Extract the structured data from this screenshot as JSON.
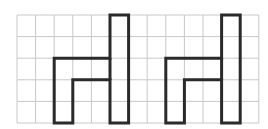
{
  "diagram": {
    "type": "grid-with-shapes",
    "grid": {
      "origin_x": 17,
      "origin_y": 15,
      "cols": 13,
      "rows": 5,
      "cell_w": 18.6,
      "cell_h": 21.6,
      "line_color": "#c8c8c8",
      "line_width": 1
    },
    "shapes": [
      {
        "name": "chair-shape-left",
        "stroke": "#2a2a2a",
        "stroke_width": 3,
        "outline_cells": [
          [
            5,
            0
          ],
          [
            6,
            0
          ],
          [
            6,
            5
          ],
          [
            5,
            5
          ],
          [
            5,
            3
          ],
          [
            3,
            3
          ],
          [
            3,
            5
          ],
          [
            2,
            5
          ],
          [
            2,
            2
          ],
          [
            5,
            2
          ]
        ]
      },
      {
        "name": "chair-shape-right",
        "stroke": "#2a2a2a",
        "stroke_width": 3,
        "outline_cells": [
          [
            11,
            0
          ],
          [
            12,
            0
          ],
          [
            12,
            5
          ],
          [
            11,
            5
          ],
          [
            11,
            3
          ],
          [
            9,
            3
          ],
          [
            9,
            5
          ],
          [
            8,
            5
          ],
          [
            8,
            2
          ],
          [
            11,
            2
          ]
        ]
      }
    ],
    "inner_lines": [
      {
        "name": "left-shape-divider",
        "from": [
          5,
          2
        ],
        "to": [
          5,
          3
        ]
      },
      {
        "name": "right-shape-divider",
        "from": [
          11,
          2
        ],
        "to": [
          11,
          3
        ]
      }
    ]
  }
}
